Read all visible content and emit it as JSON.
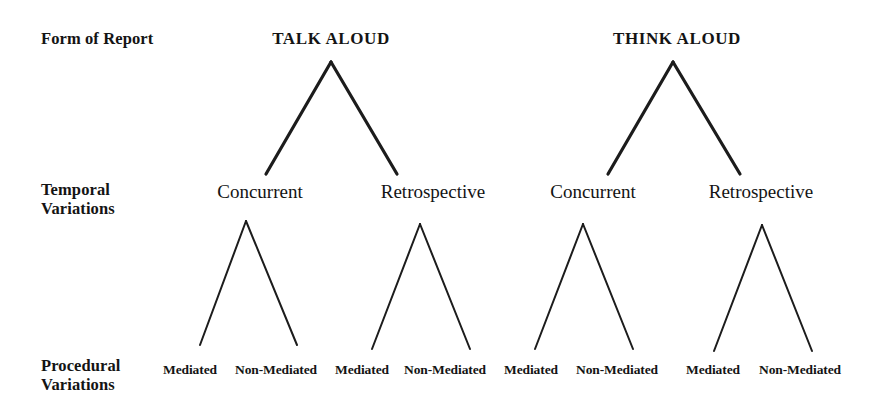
{
  "figure": {
    "background_color": "#ffffff",
    "line_color": "#1c1c1c",
    "text_color": "#141414"
  },
  "row_labels": [
    {
      "id": "form-of-report",
      "text": "Form of Report",
      "x": 41,
      "y": 29
    },
    {
      "id": "temporal-variations",
      "text": "Temporal\nVariations",
      "x": 41,
      "y": 180
    },
    {
      "id": "procedural-variations",
      "text": "Procedural\nVariations",
      "x": 41,
      "y": 356
    }
  ],
  "levels": {
    "form_of_report": {
      "label": "Form of Report",
      "nodes": [
        {
          "id": "talk-aloud",
          "label": "TALK ALOUD",
          "x": 331,
          "y": 29
        },
        {
          "id": "think-aloud",
          "label": "THINK ALOUD",
          "x": 677,
          "y": 29
        }
      ]
    },
    "temporal_variations": {
      "label": "Temporal Variations",
      "nodes": [
        {
          "id": "talk-concurrent",
          "label": "Concurrent",
          "parent": "talk-aloud",
          "x": 260,
          "y": 181
        },
        {
          "id": "talk-retrospective",
          "label": "Retrospective",
          "parent": "talk-aloud",
          "x": 433,
          "y": 181
        },
        {
          "id": "think-concurrent",
          "label": "Concurrent",
          "parent": "think-aloud",
          "x": 593,
          "y": 181
        },
        {
          "id": "think-retrospective",
          "label": "Retrospective",
          "parent": "think-aloud",
          "x": 761,
          "y": 181
        }
      ]
    },
    "procedural_variations": {
      "label": "Procedural Variations",
      "nodes": [
        {
          "id": "talk-concurrent-mediated",
          "label": "Mediated",
          "parent": "talk-concurrent",
          "x": 190,
          "y": 362
        },
        {
          "id": "talk-concurrent-non-mediated",
          "label": "Non-Mediated",
          "parent": "talk-concurrent",
          "x": 276,
          "y": 362
        },
        {
          "id": "talk-retrospective-mediated",
          "label": "Mediated",
          "parent": "talk-retrospective",
          "x": 362,
          "y": 362
        },
        {
          "id": "talk-retrospective-non-mediated",
          "label": "Non-Mediated",
          "parent": "talk-retrospective",
          "x": 445,
          "y": 362
        },
        {
          "id": "think-concurrent-mediated",
          "label": "Mediated",
          "parent": "think-concurrent",
          "x": 531,
          "y": 362
        },
        {
          "id": "think-concurrent-non-mediated",
          "label": "Non-Mediated",
          "parent": "think-concurrent",
          "x": 617,
          "y": 362
        },
        {
          "id": "think-retrospective-mediated",
          "label": "Mediated",
          "parent": "think-retrospective",
          "x": 713,
          "y": 362
        },
        {
          "id": "think-retrospective-non-mediated",
          "label": "Non-Mediated",
          "parent": "think-retrospective",
          "x": 800,
          "y": 362
        }
      ]
    }
  },
  "connectors": {
    "stroke_width_major": 3.2,
    "stroke_width_minor": 2.0,
    "major": [
      {
        "id": "talk-aloud-to-concurrent",
        "x1": 331,
        "y1": 62,
        "x2": 266,
        "y2": 174
      },
      {
        "id": "talk-aloud-to-retrospective",
        "x1": 331,
        "y1": 62,
        "x2": 397,
        "y2": 174
      },
      {
        "id": "think-aloud-to-concurrent",
        "x1": 673,
        "y1": 62,
        "x2": 608,
        "y2": 174
      },
      {
        "id": "think-aloud-to-retrospective",
        "x1": 673,
        "y1": 62,
        "x2": 740,
        "y2": 174
      }
    ],
    "minor": [
      {
        "id": "talk-concurrent-to-mediated",
        "x1": 246,
        "y1": 221,
        "x2": 200,
        "y2": 345
      },
      {
        "id": "talk-concurrent-to-non-mediated",
        "x1": 246,
        "y1": 221,
        "x2": 297,
        "y2": 345
      },
      {
        "id": "talk-retrospective-to-mediated",
        "x1": 420,
        "y1": 224,
        "x2": 372,
        "y2": 349
      },
      {
        "id": "talk-retrospective-to-non-mediated",
        "x1": 420,
        "y1": 224,
        "x2": 470,
        "y2": 349
      },
      {
        "id": "think-concurrent-to-mediated",
        "x1": 583,
        "y1": 224,
        "x2": 535,
        "y2": 349
      },
      {
        "id": "think-concurrent-to-non-mediated",
        "x1": 583,
        "y1": 224,
        "x2": 633,
        "y2": 349
      },
      {
        "id": "think-retrospective-to-mediated",
        "x1": 762,
        "y1": 225,
        "x2": 714,
        "y2": 351
      },
      {
        "id": "think-retrospective-to-non-mediated",
        "x1": 762,
        "y1": 225,
        "x2": 812,
        "y2": 351
      }
    ]
  }
}
